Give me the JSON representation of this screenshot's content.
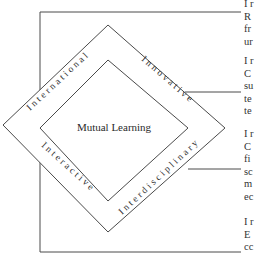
{
  "diagram": {
    "center_label": "Mutual Learning",
    "sides": {
      "top_left": "International",
      "top_right": "Innovative",
      "bottom_left": "Interactive",
      "bottom_right": "Interdisciplinary"
    }
  },
  "side_text": {
    "blocks": [
      {
        "lines": [
          "I r",
          "R",
          "fr",
          "ur"
        ]
      },
      {
        "lines": [
          "I r",
          "C",
          "su",
          "te",
          "te"
        ]
      },
      {
        "lines": [
          "I r",
          "C",
          "fi",
          "sc",
          "m",
          "ec"
        ]
      },
      {
        "lines": [
          "I r",
          "E",
          "cc"
        ]
      }
    ]
  },
  "colors": {
    "line": "#4a4a4a",
    "text": "#333333",
    "background": "#ffffff"
  }
}
